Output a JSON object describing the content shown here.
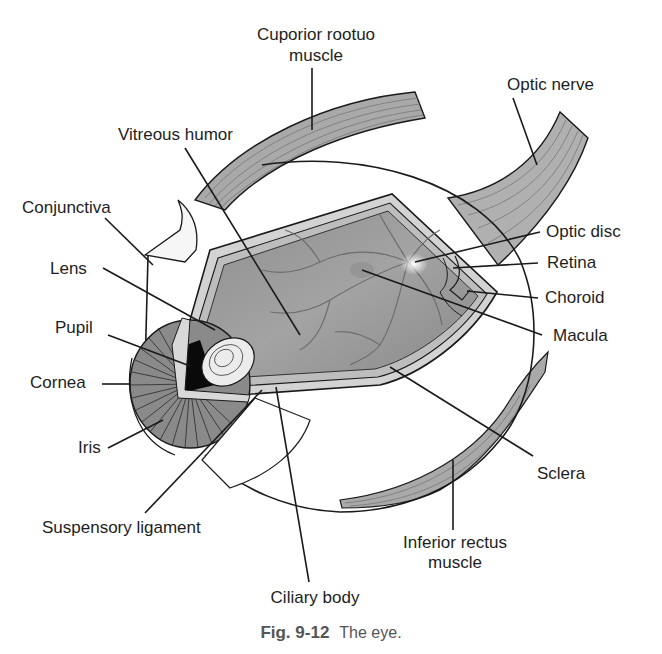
{
  "figure": {
    "caption_number": "Fig. 9-12",
    "caption_text": "The eye."
  },
  "labels": {
    "superior_rectus_line1": "Cuporior rootuo",
    "superior_rectus_line2": "muscle",
    "optic_nerve": "Optic nerve",
    "vitreous_humor": "Vitreous humor",
    "conjunctiva": "Conjunctiva",
    "optic_disc": "Optic disc",
    "lens": "Lens",
    "retina": "Retina",
    "choroid": "Choroid",
    "pupil": "Pupil",
    "macula": "Macula",
    "cornea": "Cornea",
    "iris": "Iris",
    "sclera": "Sclera",
    "suspensory_ligament": "Suspensory ligament",
    "inferior_rectus_line1": "Inferior rectus",
    "inferior_rectus_line2": "muscle",
    "ciliary_body": "Ciliary body"
  },
  "colors": {
    "ink": "#1a1a1a",
    "muscle": "#a9a9a9",
    "vitreous": "#9c9c9c",
    "layer_band": "#c8c8c8",
    "iris": "#8a8a8a",
    "pupil": "#0a0a0a",
    "background": "#ffffff"
  }
}
